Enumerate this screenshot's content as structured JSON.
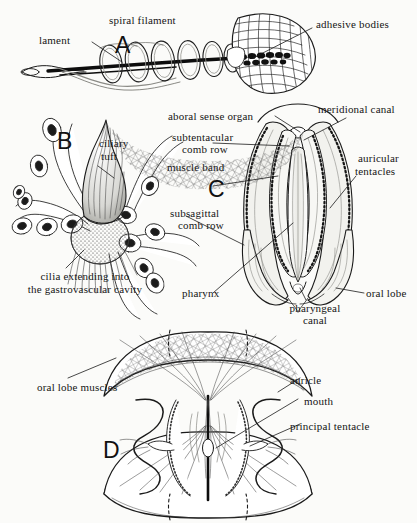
{
  "figure": {
    "background_color": "#fbfbf9",
    "ink_color": "#151515",
    "panels": [
      {
        "letter": "A",
        "subject": "spiral filament with adhesive bodies (colloblast / tentilla)",
        "labels": [
          "lament",
          "spiral filament",
          "adhesive bodies"
        ]
      },
      {
        "letter": "B",
        "subject": "ciliary tuft and surrounding cells",
        "labels": [
          "ciliary tuft",
          "cilia extending into",
          "the gastrovascular cavity"
        ]
      },
      {
        "letter": "C",
        "subject": "whole-animal view with comb rows and canals",
        "labels": [
          "aboral sense organ",
          "subtentacular",
          "comb row",
          "muscle band",
          "subsagittal",
          "comb row",
          "pharynx",
          "meridional canal",
          "auricular",
          "tentacles",
          "oral lobe",
          "pharyngeal",
          "canal"
        ]
      },
      {
        "letter": "D",
        "subject": "oral view showing oral lobe musculature, auricles and mouth",
        "labels": [
          "oral lobe muscles",
          "auricle",
          "mouth",
          "principal tentacle"
        ]
      }
    ]
  },
  "panelA": {
    "letter": "A",
    "label_filament": "lament",
    "label_spiral": "spiral filament",
    "label_adhesive": "adhesive bodies"
  },
  "panelB": {
    "letter": "B",
    "label_ciliary_line1": "ciliary",
    "label_ciliary_line2": "tuft",
    "label_cilia_line1": "cilia extending into",
    "label_cilia_line2": "the gastrovascular cavity"
  },
  "panelC": {
    "letter": "C",
    "label_aboral": "aboral sense organ",
    "label_subtentacular_line1": "subtentacular",
    "label_subtentacular_line2": "comb row",
    "label_muscle_band": "muscle band",
    "label_subsagittal_line1": "subsagittal",
    "label_subsagittal_line2": "comb row",
    "label_pharynx": "pharynx",
    "label_meridional": "meridional canal",
    "label_auricular_line1": "auricular",
    "label_auricular_line2": "tentacles",
    "label_oral_lobe": "oral lobe",
    "label_pharyngeal_line1": "pharyngeal",
    "label_pharyngeal_line2": "canal"
  },
  "panelD": {
    "letter": "D",
    "label_oral_lobe_muscles": "oral lobe muscles",
    "label_auricle": "auricle",
    "label_mouth": "mouth",
    "label_principal_tentacle": "principal tentacle"
  }
}
